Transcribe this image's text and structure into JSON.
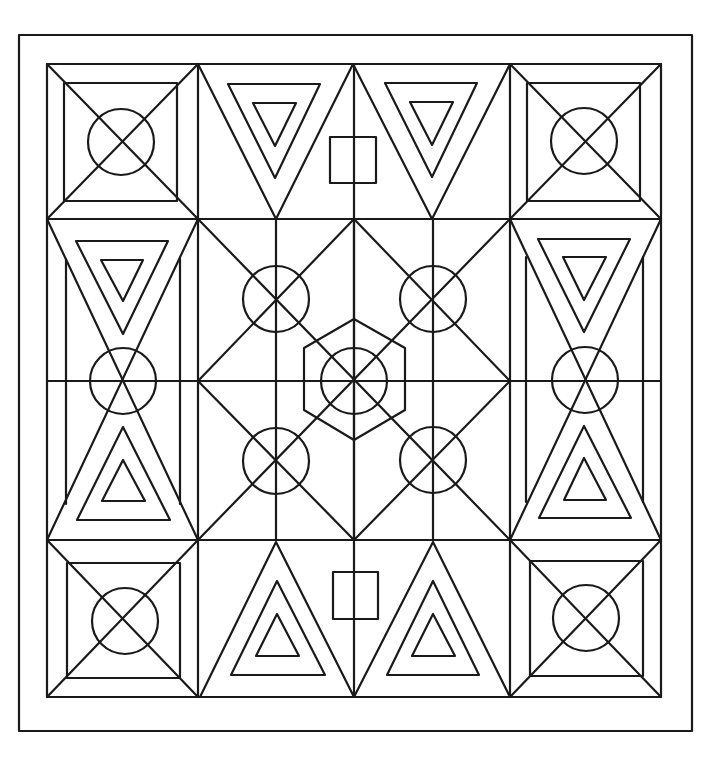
{
  "image": {
    "description": "Geometric coloring-page pattern: square frame with 3x3 tile grid of squares, triangles, circles and a central hexagon",
    "width": 723,
    "height": 758,
    "background": "#ffffff",
    "stroke_color": "#1a1a1a"
  },
  "frame": {
    "outer_border": {
      "x1": 19,
      "y1": 35,
      "x2": 692,
      "y2": 731
    },
    "inner_border": {
      "x1": 47,
      "y1": 64,
      "x2": 661,
      "y2": 697
    }
  },
  "grid": {
    "columns_x": [
      47,
      198,
      510,
      661
    ],
    "rows_y": [
      64,
      219,
      540,
      697
    ],
    "midline_y": 381,
    "center_x": 354
  },
  "corner_tiles": [
    {
      "name": "top-left",
      "cell": [
        47,
        64,
        198,
        219
      ],
      "inner": [
        64,
        83,
        177,
        201
      ],
      "circle": {
        "cx": 121,
        "cy": 142,
        "r": 33
      }
    },
    {
      "name": "top-right",
      "cell": [
        510,
        64,
        661,
        219
      ],
      "inner": [
        527,
        83,
        640,
        201
      ],
      "circle": {
        "cx": 584,
        "cy": 141,
        "r": 33
      }
    },
    {
      "name": "bottom-left",
      "cell": [
        47,
        540,
        198,
        697
      ],
      "inner": [
        67,
        563,
        180,
        678
      ],
      "circle": {
        "cx": 125,
        "cy": 621,
        "r": 33
      }
    },
    {
      "name": "bottom-right",
      "cell": [
        510,
        540,
        661,
        697
      ],
      "inner": [
        530,
        561,
        643,
        676
      ],
      "circle": {
        "cx": 586,
        "cy": 618,
        "r": 33
      }
    }
  ],
  "top_triangles": [
    {
      "outer": [
        [
          198,
          64
        ],
        [
          353,
          64
        ],
        [
          276,
          219
        ]
      ],
      "middle": [
        [
          228,
          84
        ],
        [
          320,
          84
        ],
        [
          275,
          178
        ]
      ],
      "inner": [
        [
          253,
          103
        ],
        [
          296,
          103
        ],
        [
          275,
          146
        ]
      ]
    },
    {
      "outer": [
        [
          353,
          64
        ],
        [
          510,
          64
        ],
        [
          432,
          219
        ]
      ],
      "middle": [
        [
          385,
          83
        ],
        [
          477,
          83
        ],
        [
          432,
          177
        ]
      ],
      "inner": [
        [
          410,
          102
        ],
        [
          453,
          102
        ],
        [
          432,
          145
        ]
      ]
    }
  ],
  "top_square": {
    "x": 330,
    "y": 137,
    "w": 46,
    "h": 46
  },
  "bottom_triangles": [
    {
      "outer": [
        [
          276,
          542
        ],
        [
          200,
          697
        ],
        [
          354,
          697
        ]
      ],
      "middle": [
        [
          277,
          581
        ],
        [
          231,
          675
        ],
        [
          325,
          675
        ]
      ],
      "inner": [
        [
          277,
          614
        ],
        [
          256,
          656
        ],
        [
          299,
          656
        ]
      ]
    },
    {
      "outer": [
        [
          433,
          542
        ],
        [
          354,
          697
        ],
        [
          510,
          697
        ]
      ],
      "middle": [
        [
          433,
          581
        ],
        [
          387,
          675
        ],
        [
          479,
          675
        ]
      ],
      "inner": [
        [
          433,
          614
        ],
        [
          412,
          656
        ],
        [
          455,
          656
        ]
      ]
    }
  ],
  "bottom_square": {
    "x": 333,
    "y": 572,
    "w": 45,
    "h": 47
  },
  "side_columns": [
    {
      "name": "left",
      "x1": 47,
      "x2": 198,
      "cx": 123,
      "inner_lines_x": [
        66,
        180
      ],
      "inner_lines_y": [
        259,
        504
      ],
      "circle": {
        "cx": 123,
        "cy": 381,
        "r": 33
      },
      "top_middle": [
        [
          76,
          241
        ],
        [
          168,
          241
        ],
        [
          123,
          334
        ]
      ],
      "top_inner": [
        [
          101,
          260
        ],
        [
          143,
          260
        ],
        [
          123,
          301
        ]
      ],
      "bottom_middle": [
        [
          123,
          427
        ],
        [
          77,
          520
        ],
        [
          170,
          520
        ]
      ],
      "bottom_inner": [
        [
          123,
          460
        ],
        [
          102,
          501
        ],
        [
          145,
          501
        ]
      ]
    },
    {
      "name": "right",
      "x1": 510,
      "x2": 661,
      "cx": 585,
      "inner_lines_x": [
        526,
        643
      ],
      "inner_lines_y": [
        257,
        502
      ],
      "circle": {
        "cx": 585,
        "cy": 380,
        "r": 33
      },
      "top_middle": [
        [
          538,
          239
        ],
        [
          630,
          239
        ],
        [
          584,
          332
        ]
      ],
      "top_inner": [
        [
          563,
          257
        ],
        [
          606,
          257
        ],
        [
          584,
          300
        ]
      ],
      "bottom_middle": [
        [
          584,
          426
        ],
        [
          539,
          518
        ],
        [
          631,
          518
        ]
      ],
      "bottom_inner": [
        [
          584,
          458
        ],
        [
          564,
          500
        ],
        [
          606,
          500
        ]
      ]
    }
  ],
  "center_block": {
    "bounds": [
      198,
      219,
      510,
      540
    ],
    "center": {
      "x": 354,
      "y": 381
    },
    "verticals_x": [
      276,
      354,
      433
    ],
    "diamond": [
      [
        354,
        219
      ],
      [
        510,
        381
      ],
      [
        354,
        540
      ],
      [
        198,
        381
      ]
    ],
    "circles": [
      {
        "cx": 276,
        "cy": 299,
        "r": 33
      },
      {
        "cx": 433,
        "cy": 299,
        "r": 33
      },
      {
        "cx": 276,
        "cy": 461,
        "r": 33
      },
      {
        "cx": 433,
        "cy": 460,
        "r": 33
      },
      {
        "cx": 354,
        "cy": 381,
        "r": 33
      }
    ],
    "hexagon": [
      [
        354,
        319
      ],
      [
        405,
        348
      ],
      [
        405,
        410
      ],
      [
        354,
        440
      ],
      [
        304,
        410
      ],
      [
        304,
        348
      ]
    ]
  }
}
